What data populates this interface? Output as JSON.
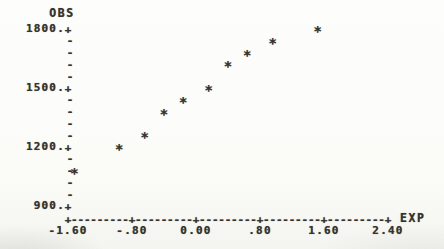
{
  "figure": {
    "ink_color": "#363430",
    "background_color": "#fbfbf8"
  },
  "chart_data": {
    "type": "scatter",
    "title": "",
    "xlabel": "EXP",
    "ylabel": "OBS",
    "marker_char": "*",
    "tick_char": "+",
    "dash_char": "-",
    "grid": false,
    "xlim": [
      -1.6,
      2.4
    ],
    "ylim": [
      900,
      1800
    ],
    "x_tick_values": [
      -1.6,
      -0.8,
      0.0,
      0.8,
      1.6,
      2.4
    ],
    "x_tick_labels": [
      "-1.60",
      "-.80",
      "0.00",
      ".80",
      "1.60",
      "2.40"
    ],
    "y_tick_values": [
      1800,
      1500,
      1200,
      900
    ],
    "y_tick_labels": [
      "1800.",
      "1500.",
      "1200.",
      "900."
    ],
    "y_minor_tick_step": 60,
    "x_minor_dashes_per_segment": 9,
    "x": [
      -1.52,
      -0.96,
      -0.64,
      -0.4,
      -0.16,
      0.16,
      0.4,
      0.64,
      0.96,
      1.52
    ],
    "y": [
      1080,
      1200,
      1260,
      1380,
      1440,
      1500,
      1620,
      1680,
      1740,
      1800
    ]
  }
}
